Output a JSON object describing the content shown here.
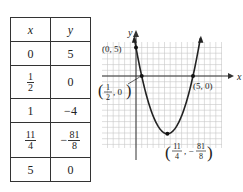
{
  "table": {
    "headers": [
      "x",
      "y"
    ],
    "rows": [
      {
        "x": {
          "type": "int",
          "text": "0"
        },
        "y": {
          "type": "int",
          "text": "5"
        }
      },
      {
        "x": {
          "type": "frac",
          "num": "1",
          "den": "2"
        },
        "y": {
          "type": "int",
          "text": "0"
        }
      },
      {
        "x": {
          "type": "int",
          "text": "1"
        },
        "y": {
          "type": "int",
          "text": "−4"
        }
      },
      {
        "x": {
          "type": "frac",
          "num": "11",
          "den": "4"
        },
        "y": {
          "type": "negfrac",
          "num": "81",
          "den": "8"
        }
      },
      {
        "x": {
          "type": "int",
          "text": "5"
        },
        "y": {
          "type": "int",
          "text": "0"
        }
      }
    ]
  },
  "graph": {
    "axis_labels": {
      "x": "x",
      "y": "y"
    },
    "function": {
      "a": 2,
      "b": -11,
      "c": 5
    },
    "x_range": [
      -1,
      6
    ],
    "y_range": [
      -12,
      6
    ],
    "points": [
      {
        "x": 0,
        "y": 5,
        "label": "(0, 5)"
      },
      {
        "x": 0.5,
        "y": 0,
        "label_parts": {
          "open": "(",
          "num": "1",
          "den": "2",
          "rest": ", 0",
          "close": ")"
        }
      },
      {
        "x": 5,
        "y": 0,
        "label": "(5, 0)"
      },
      {
        "x": 2.75,
        "y": -10.125,
        "label_parts": {
          "open": "(",
          "num1": "11",
          "den1": "4",
          "sep": ", −",
          "num2": "81",
          "den2": "8",
          "close": ")"
        }
      }
    ],
    "colors": {
      "grid": "#c8c8c8",
      "axis": "#333333",
      "curve": "#222222"
    }
  }
}
